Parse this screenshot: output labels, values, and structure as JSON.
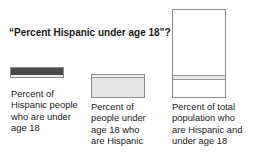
{
  "title": "“Percent Hispanic under age 18”?",
  "colors": {
    "dark_fill": "#4a4a4a",
    "light_fill": "#e6e6e6",
    "outline": "#8a8a8a",
    "white": "#ffffff"
  },
  "panels": [
    {
      "name": "hispanic-people-under-18",
      "label_lines": [
        "Percent of",
        "Hispanic people",
        "who are under",
        "age 18"
      ]
    },
    {
      "name": "people-under-18-hispanic",
      "label_lines": [
        "Percent of",
        "people under",
        "age 18 who",
        "are Hispanic"
      ]
    },
    {
      "name": "total-population-hispanic-under-18",
      "label_lines": [
        "Percent of total",
        "population who",
        "are Hispanic and",
        "under age 18"
      ]
    }
  ]
}
